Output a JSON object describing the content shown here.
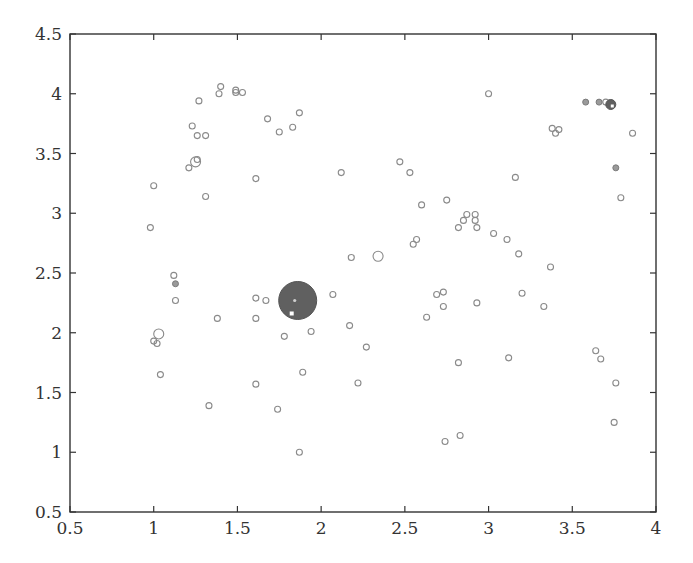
{
  "chart_data": {
    "type": "scatter",
    "title": "",
    "xlabel": "",
    "ylabel": "",
    "xlim": [
      0.5,
      4
    ],
    "ylim": [
      0.5,
      4.5
    ],
    "grid": false,
    "legend": null,
    "x_ticks": [
      "0.5",
      "1",
      "1.5",
      "2",
      "2.5",
      "3",
      "3.5",
      "4"
    ],
    "y_ticks": [
      "0.5",
      "1",
      "1.5",
      "2",
      "2.5",
      "3",
      "3.5",
      "4",
      "4.5"
    ],
    "colors": {
      "open_marker": "#8a8a8a",
      "filled_marker": "#9a9a9a",
      "dark_marker": "#606060",
      "axis": "#333333"
    },
    "series": [
      {
        "name": "points",
        "marker": "open-circle",
        "points": [
          [
            1.4,
            4.06
          ],
          [
            1.39,
            4.0
          ],
          [
            1.49,
            4.03
          ],
          [
            1.49,
            4.01
          ],
          [
            1.53,
            4.01
          ],
          [
            1.27,
            3.94
          ],
          [
            1.68,
            3.79
          ],
          [
            1.87,
            3.84
          ],
          [
            1.23,
            3.73
          ],
          [
            1.26,
            3.65
          ],
          [
            1.31,
            3.65
          ],
          [
            1.75,
            3.68
          ],
          [
            1.83,
            3.72
          ],
          [
            1.26,
            3.45
          ],
          [
            1.21,
            3.38
          ],
          [
            1.61,
            3.29
          ],
          [
            2.12,
            3.34
          ],
          [
            1.0,
            3.23
          ],
          [
            1.31,
            3.14
          ],
          [
            0.98,
            2.88
          ],
          [
            2.47,
            3.43
          ],
          [
            2.53,
            3.34
          ],
          [
            3.16,
            3.3
          ],
          [
            3.0,
            4.0
          ],
          [
            3.38,
            3.71
          ],
          [
            3.4,
            3.67
          ],
          [
            3.42,
            3.7
          ],
          [
            2.6,
            3.07
          ],
          [
            2.75,
            3.11
          ],
          [
            2.82,
            2.88
          ],
          [
            2.85,
            2.94
          ],
          [
            2.87,
            2.99
          ],
          [
            2.92,
            2.99
          ],
          [
            2.92,
            2.94
          ],
          [
            2.93,
            2.88
          ],
          [
            3.03,
            2.83
          ],
          [
            3.11,
            2.78
          ],
          [
            3.18,
            2.66
          ],
          [
            3.37,
            2.55
          ],
          [
            2.55,
            2.74
          ],
          [
            2.57,
            2.78
          ],
          [
            2.18,
            2.63
          ],
          [
            2.69,
            2.32
          ],
          [
            2.73,
            2.34
          ],
          [
            2.73,
            2.22
          ],
          [
            2.93,
            2.25
          ],
          [
            3.2,
            2.33
          ],
          [
            3.33,
            2.22
          ],
          [
            2.63,
            2.13
          ],
          [
            1.12,
            2.48
          ],
          [
            1.13,
            2.27
          ],
          [
            1.38,
            2.12
          ],
          [
            1.61,
            2.29
          ],
          [
            1.67,
            2.27
          ],
          [
            1.61,
            2.12
          ],
          [
            2.07,
            2.32
          ],
          [
            1.0,
            1.93
          ],
          [
            1.02,
            1.91
          ],
          [
            1.04,
            1.65
          ],
          [
            1.61,
            1.57
          ],
          [
            1.89,
            1.67
          ],
          [
            1.78,
            1.97
          ],
          [
            1.94,
            2.01
          ],
          [
            2.17,
            2.06
          ],
          [
            2.27,
            1.88
          ],
          [
            2.22,
            1.58
          ],
          [
            1.33,
            1.39
          ],
          [
            1.74,
            1.36
          ],
          [
            1.87,
            1.0
          ],
          [
            2.74,
            1.09
          ],
          [
            2.83,
            1.14
          ],
          [
            2.82,
            1.75
          ],
          [
            3.12,
            1.79
          ],
          [
            3.76,
            1.58
          ],
          [
            3.75,
            1.25
          ],
          [
            3.64,
            1.85
          ],
          [
            3.67,
            1.78
          ],
          [
            3.7,
            3.93
          ],
          [
            3.86,
            3.67
          ],
          [
            3.79,
            3.13
          ]
        ],
        "size": 3
      },
      {
        "name": "larger-open",
        "marker": "open-circle",
        "points": [
          [
            1.25,
            3.43
          ],
          [
            1.03,
            1.99
          ],
          [
            2.34,
            2.64
          ]
        ],
        "size": 5
      },
      {
        "name": "filled-small",
        "marker": "filled-circle",
        "points": [
          [
            1.13,
            2.41
          ],
          [
            3.58,
            3.93
          ],
          [
            3.66,
            3.93
          ],
          [
            3.76,
            3.38
          ]
        ],
        "size": 3
      },
      {
        "name": "dark-medium",
        "marker": "dark-circle",
        "points": [
          [
            3.73,
            3.91
          ]
        ],
        "size": 5
      },
      {
        "name": "dark-large",
        "marker": "dark-circle",
        "points": [
          [
            1.86,
            2.27
          ]
        ],
        "size": 19
      }
    ]
  }
}
